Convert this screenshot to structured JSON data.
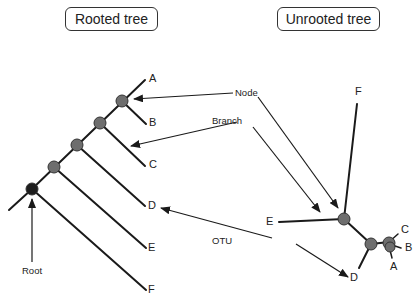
{
  "rooted": {
    "title": "Rooted tree",
    "leaves": [
      "A",
      "B",
      "C",
      "D",
      "E",
      "F"
    ],
    "root_label": "Root"
  },
  "unrooted": {
    "title": "Unrooted tree",
    "leaves": [
      "A",
      "B",
      "C",
      "D",
      "E",
      "F"
    ]
  },
  "annotations": {
    "node": "Node",
    "branch": "Branch",
    "otu": "OTU"
  },
  "colors": {
    "line": "#1a1a1a",
    "node_fill": "#6e6e6e",
    "root_fill": "#1e1e1e",
    "arrow": "#1a1a1a"
  }
}
